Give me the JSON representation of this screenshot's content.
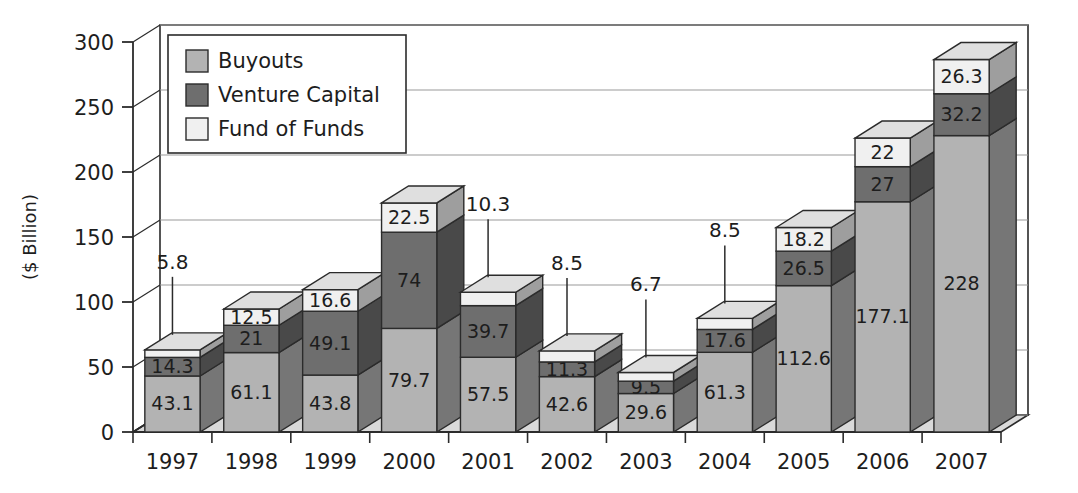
{
  "chart_data": {
    "type": "bar",
    "subtype": "stacked-3d-column",
    "title": "",
    "xlabel": "",
    "ylabel": "($ Billion)",
    "ylim": [
      0,
      300
    ],
    "ytick_values": [
      0,
      50,
      100,
      150,
      200,
      250,
      300
    ],
    "ytick_labels": [
      "0",
      "50",
      "100",
      "150",
      "200",
      "250",
      "300"
    ],
    "grid": true,
    "legend_position": "top-left-inside",
    "categories": [
      "1997",
      "1998",
      "1999",
      "2000",
      "2001",
      "2002",
      "2003",
      "2004",
      "2005",
      "2006",
      "2007"
    ],
    "series": [
      {
        "name": "Buyouts",
        "color": "#b3b3b3",
        "values": [
          43.1,
          61.1,
          43.8,
          79.7,
          57.5,
          42.6,
          29.6,
          61.3,
          112.6,
          177.1,
          228
        ],
        "labels": [
          "43.1",
          "61.1",
          "43.8",
          "79.7",
          "57.5",
          "42.6",
          "29.6",
          "61.3",
          "112.6",
          "177.1",
          "228"
        ]
      },
      {
        "name": "Venture Capital",
        "color": "#6e6e6e",
        "values": [
          14.3,
          21,
          49.1,
          74,
          39.7,
          11.3,
          9.5,
          17.6,
          26.5,
          27,
          32.2
        ],
        "labels": [
          "14.3",
          "21",
          "49.1",
          "74",
          "39.7",
          "11.3",
          "9.5",
          "17.6",
          "26.5",
          "27",
          "32.2"
        ]
      },
      {
        "name": "Fund of Funds",
        "color": "#f0f0f0",
        "values": [
          5.8,
          12.5,
          16.6,
          22.5,
          10.3,
          8.5,
          6.7,
          8.5,
          18.2,
          22,
          26.3
        ],
        "labels": [
          "5.8",
          "12.5",
          "16.6",
          "22.5",
          "10.3",
          "8.5",
          "6.7",
          "8.5",
          "18.2",
          "22",
          "26.3"
        ],
        "label_callout": [
          true,
          false,
          false,
          false,
          true,
          true,
          true,
          true,
          false,
          false,
          false
        ]
      }
    ],
    "totals": [
      63.2,
      94.6,
      109.5,
      176.2,
      107.5,
      62.4,
      45.8,
      87.4,
      157.3,
      226.1,
      286.5
    ]
  },
  "legend": {
    "items": [
      {
        "label": "Buyouts",
        "color": "#b3b3b3"
      },
      {
        "label": "Venture Capital",
        "color": "#6e6e6e"
      },
      {
        "label": "Fund of Funds",
        "color": "#f0f0f0"
      }
    ]
  },
  "colors": {
    "background": "#ffffff",
    "buyouts": "#b3b3b3",
    "venture_capital": "#6e6e6e",
    "fund_of_funds": "#f0f0f0",
    "floor": "#d9d9d9",
    "outline": "#2b2b2b",
    "gridline": "#9a9a9a"
  }
}
